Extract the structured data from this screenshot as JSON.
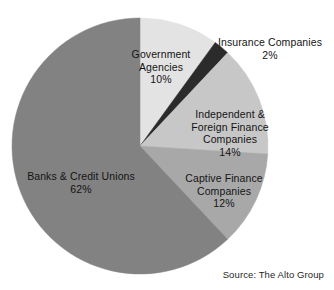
{
  "chart_data": {
    "type": "pie",
    "title": "",
    "categories": [
      "Government Agencies",
      "Insurance Companies",
      "Independent & Foreign Finance Companies",
      "Captive Finance Companies",
      "Banks & Credit Unions"
    ],
    "values": [
      10,
      2,
      14,
      12,
      62
    ],
    "unit": "%",
    "legend": "none",
    "grid": false,
    "start_angle_deg": 0,
    "direction": "clockwise",
    "colors": [
      "#e3e3e3",
      "#2b2b2b",
      "#c7c7c7",
      "#a8a8a8",
      "#828282"
    ],
    "slices": [
      {
        "name": "Government Agencies",
        "value": 10,
        "label_lines": [
          "Government",
          "Agencies"
        ],
        "value_label": "10%",
        "color": "#e3e3e3",
        "label_placement": "inside"
      },
      {
        "name": "Insurance Companies",
        "value": 2,
        "label_lines": [
          "Insurance Companies"
        ],
        "value_label": "2%",
        "color": "#2b2b2b",
        "label_placement": "outside"
      },
      {
        "name": "Independent & Foreign Finance Companies",
        "value": 14,
        "label_lines": [
          "Independent &",
          "Foreign Finance",
          "Companies"
        ],
        "value_label": "14%",
        "color": "#c7c7c7",
        "label_placement": "inside"
      },
      {
        "name": "Captive Finance Companies",
        "value": 12,
        "label_lines": [
          "Captive Finance",
          "Companies"
        ],
        "value_label": "12%",
        "color": "#a8a8a8",
        "label_placement": "inside"
      },
      {
        "name": "Banks & Credit Unions",
        "value": 62,
        "label_lines": [
          "Banks & Credit Unions"
        ],
        "value_label": "62%",
        "color": "#828282",
        "label_placement": "inside"
      }
    ],
    "source": "Source: The Alto Group"
  },
  "labels": {
    "government": {
      "text": "Government\nAgencies",
      "pct": "10%"
    },
    "insurance": {
      "text": "Insurance Companies",
      "pct": "2%"
    },
    "independent": {
      "text": "Independent &\nForeign Finance\nCompanies",
      "pct": "14%"
    },
    "captive": {
      "text": "Captive Finance\nCompanies",
      "pct": "12%"
    },
    "banks": {
      "text": "Banks & Credit Unions",
      "pct": "62%"
    }
  },
  "footer": {
    "source": "Source: The Alto Group"
  },
  "geometry": {
    "center_x": 140,
    "center_y": 146,
    "radius": 128
  }
}
